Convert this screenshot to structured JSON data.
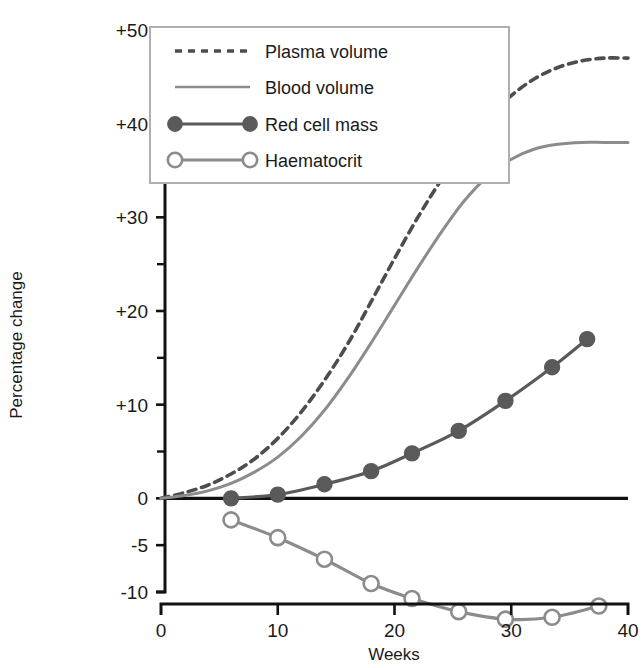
{
  "chart_data": {
    "type": "line",
    "title": "",
    "xlabel": "Weeks",
    "ylabel": "Percentage change",
    "xlim": [
      0,
      40
    ],
    "ylim": [
      -10,
      50
    ],
    "grid": false,
    "legend_position": "top-left",
    "x_ticks": [
      "0",
      "10",
      "20",
      "30",
      "40"
    ],
    "x_tick_values": [
      0,
      10,
      20,
      30,
      40
    ],
    "y_ticks": [
      "+50",
      "+40",
      "+30",
      "+20",
      "+10",
      "0",
      "-5",
      "-10"
    ],
    "y_tick_values": [
      50,
      40,
      30,
      20,
      10,
      0,
      -5,
      -10
    ],
    "y_minor_ticks": [
      45,
      35,
      25,
      15,
      5
    ],
    "zero_reference_line": 0,
    "series": [
      {
        "name": "Plasma volume",
        "style": "dashed",
        "marker": "none",
        "color": "#4d4d4d",
        "x": [
          0,
          2,
          4,
          6,
          8,
          10,
          12,
          14,
          16,
          18,
          20,
          22,
          24,
          26,
          28,
          30,
          32,
          34,
          36,
          38,
          40
        ],
        "values": [
          0,
          0.6,
          1.4,
          2.6,
          4.2,
          6.4,
          9.2,
          12.6,
          16.5,
          21.0,
          25.6,
          30.0,
          34.0,
          37.6,
          40.6,
          43.0,
          44.8,
          46.0,
          46.7,
          47.0,
          47.0
        ]
      },
      {
        "name": "Blood volume",
        "style": "solid",
        "marker": "none",
        "color": "#8c8c8c",
        "x": [
          0,
          2,
          4,
          6,
          8,
          10,
          12,
          14,
          16,
          18,
          20,
          22,
          24,
          26,
          28,
          30,
          32,
          34,
          36,
          38,
          40
        ],
        "values": [
          0,
          0.3,
          0.8,
          1.6,
          2.8,
          4.4,
          6.6,
          9.4,
          12.8,
          16.6,
          20.6,
          24.6,
          28.4,
          31.8,
          34.4,
          36.2,
          37.3,
          37.8,
          38.0,
          38.0,
          38.0
        ]
      },
      {
        "name": "Red cell mass",
        "style": "solid",
        "marker": "filled-circle",
        "color": "#5a5a5a",
        "x": [
          6,
          10,
          14,
          18,
          21.5,
          25.5,
          29.5,
          33.5,
          36.5
        ],
        "values": [
          0.0,
          0.4,
          1.5,
          2.9,
          4.8,
          7.2,
          10.4,
          14.0,
          17.0
        ]
      },
      {
        "name": "Haematocrit",
        "style": "solid",
        "marker": "open-circle",
        "color": "#8c8c8c",
        "x": [
          6,
          10,
          14,
          18,
          21.5,
          25.5,
          29.5,
          33.5,
          37.5
        ],
        "values": [
          -2.3,
          -4.2,
          -6.5,
          -9.1,
          -10.7,
          -12.1,
          -12.9,
          -12.7,
          -11.5
        ]
      }
    ]
  },
  "legend": {
    "entries": [
      {
        "label": "Plasma volume",
        "symbol": "dashed-line"
      },
      {
        "label": "Blood volume",
        "symbol": "solid-line"
      },
      {
        "label": "Red cell mass",
        "symbol": "filled-circle-line"
      },
      {
        "label": "Haematocrit",
        "symbol": "open-circle-line"
      }
    ]
  },
  "axes": {
    "y_title": "Percentage change",
    "x_title": "Weeks"
  },
  "colors": {
    "axis": "#111111",
    "plasma": "#4d4d4d",
    "blood": "#8c8c8c",
    "redcell": "#5a5a5a",
    "haematocrit": "#8c8c8c",
    "legend_border": "#b0b0b0"
  }
}
